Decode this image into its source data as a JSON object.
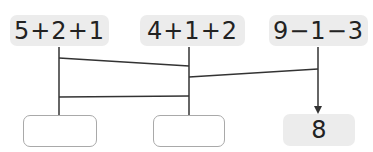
{
  "expressions": [
    {
      "text": "5+2+1"
    },
    {
      "text": "4+1+2"
    },
    {
      "text": "9−1−3"
    }
  ],
  "answers": [
    {
      "value": ""
    },
    {
      "value": ""
    },
    {
      "value": "8"
    }
  ],
  "colors": {
    "box_fill": "#ececec",
    "line": "#333333",
    "empty_border": "#a9a9a9"
  }
}
